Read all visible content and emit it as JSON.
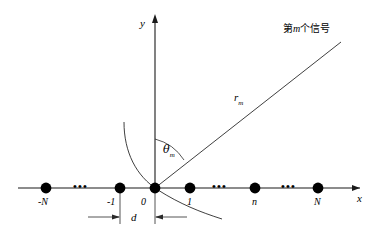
{
  "figure": {
    "kind": "coordinate-diagram",
    "background_color": "#ffffff",
    "stroke_color": "#1a1a1a",
    "marker_color": "#000000",
    "width": 378,
    "height": 244
  },
  "axes": {
    "x_label": "x",
    "y_label": "y",
    "x_axis_y": 188,
    "origin_x": 155
  },
  "elements": {
    "source_label": "第m个信号",
    "source_label_prefix": "第",
    "source_label_index": "m",
    "source_label_suffix": "个信号",
    "range_label": "r",
    "range_label_sub": "m",
    "angle_label": "θ",
    "angle_label_sub": "m",
    "spacing_label": "d"
  },
  "array_elements": [
    {
      "name": "element-minus-N",
      "label": "-N",
      "x": 46
    },
    {
      "name": "element-minus-1",
      "label": "-1",
      "x": 120
    },
    {
      "name": "element-0",
      "label": "0",
      "x": 155
    },
    {
      "name": "element-1",
      "label": "1",
      "x": 190
    },
    {
      "name": "element-n",
      "label": "n",
      "x": 255
    },
    {
      "name": "element-N",
      "label": "N",
      "x": 318
    }
  ],
  "ellipses": [
    {
      "name": "ellipsis-left",
      "label": "•••",
      "x": 80
    },
    {
      "name": "ellipsis-middle",
      "label": "•••",
      "x": 219
    },
    {
      "name": "ellipsis-right",
      "label": "•••",
      "x": 288
    }
  ]
}
